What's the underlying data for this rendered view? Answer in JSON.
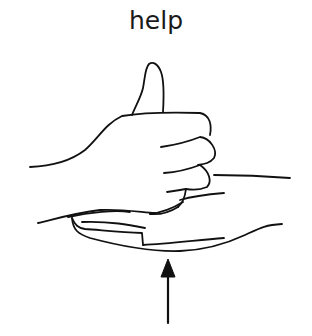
{
  "sign": {
    "word": "help",
    "illustration": "thumbs-up fist resting on open flat palm, arrow pointing upward beneath",
    "stroke_color": "#111111",
    "background_color": "#ffffff"
  }
}
